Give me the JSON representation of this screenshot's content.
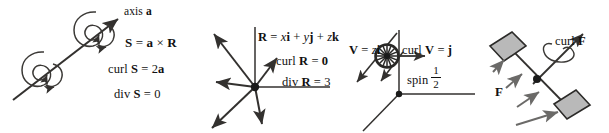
{
  "figure": {
    "background_color": "#ffffff",
    "ink_color": "#111111",
    "paddle_fill_color": "#b9b9b9"
  },
  "panels": [
    {
      "id": "axis-rotation",
      "name": "rigid-rotation-field",
      "labels": {
        "axis": "axis a",
        "definition": "S = a × R",
        "curl": "curl S = 2a",
        "divergence": "div S = 0"
      },
      "definition_parts": {
        "lhs": "S",
        "eq": " = ",
        "a": "a",
        "cross": " × ",
        "r": "R"
      },
      "curl_parts": {
        "op": "curl ",
        "field": "S",
        "eq": " = 2",
        "result": "a"
      },
      "div_parts": {
        "op": "div ",
        "field": "S",
        "eq": " = 0"
      },
      "glyphs": {
        "spiral_count": 2,
        "arrow": "axis-arrow"
      }
    },
    {
      "id": "position-field",
      "name": "radial-position-field",
      "labels": {
        "definition": "R = xi + yj + zk",
        "curl": "curl R = 0",
        "divergence": "div R = 3"
      },
      "definition_parts": {
        "lhs": "R",
        "eq": " = ",
        "x": "x",
        "i": "i",
        "plus1": " + ",
        "y": "y",
        "j": "j",
        "plus2": " + ",
        "z": "z",
        "k": "k"
      },
      "curl_parts": {
        "op": "curl ",
        "field": "R",
        "eq": " = ",
        "result": "0"
      },
      "div_parts": {
        "op": "div ",
        "field": "R",
        "eq": " = 3"
      },
      "glyphs": {
        "radiating_vectors": 8,
        "origin": "origin-dot"
      }
    },
    {
      "id": "shear-field",
      "name": "shear-flow-field",
      "labels": {
        "definition": "V = zi",
        "curl": "curl V = j",
        "spin": "spin",
        "spin_numerator": "1",
        "spin_denominator": "2"
      },
      "definition_parts": {
        "lhs": "V",
        "eq": " = ",
        "z": "z",
        "i": "i"
      },
      "curl_parts": {
        "op": "curl ",
        "field": "V",
        "eq": " = ",
        "result": "j"
      },
      "glyphs": {
        "pinwheel": "pinwheel-icon",
        "shear_arrows": 2
      }
    },
    {
      "id": "paddle-wheel",
      "name": "paddle-wheel-field",
      "labels": {
        "curl": "curl F",
        "field": "F"
      },
      "curl_parts": {
        "op": "curl ",
        "field": "F"
      },
      "glyphs": {
        "paddles": 2,
        "force_arrows": 4,
        "hub": "hub-dot"
      }
    }
  ]
}
